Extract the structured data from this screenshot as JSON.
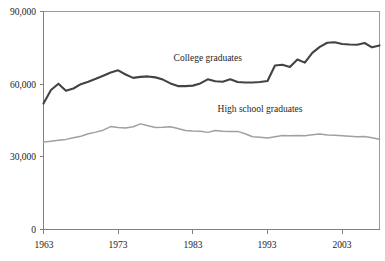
{
  "chart_data": {
    "type": "line",
    "title": "",
    "subtitle": "",
    "xlabel": "",
    "ylabel": "",
    "xlim": [
      1963,
      2008
    ],
    "ylim": [
      0,
      90000
    ],
    "grid": false,
    "legend_position": "inline-annotation",
    "y_ticks": [
      0,
      30000,
      60000,
      90000
    ],
    "y_tick_labels": [
      "0",
      "30,000",
      "60,000",
      "90,000"
    ],
    "x_ticks": [
      1963,
      1973,
      1983,
      1993,
      2003
    ],
    "x_tick_labels": [
      "1963",
      "1973",
      "1983",
      "1993",
      "2003"
    ],
    "x": [
      1963,
      1964,
      1965,
      1966,
      1967,
      1968,
      1969,
      1970,
      1971,
      1972,
      1973,
      1974,
      1975,
      1976,
      1977,
      1978,
      1979,
      1980,
      1981,
      1982,
      1983,
      1984,
      1985,
      1986,
      1987,
      1988,
      1989,
      1990,
      1991,
      1992,
      1993,
      1994,
      1995,
      1996,
      1997,
      1998,
      1999,
      2000,
      2001,
      2002,
      2003,
      2004,
      2005,
      2006,
      2007,
      2008
    ],
    "series": [
      {
        "name": "College graduates",
        "color": "#434343",
        "label_x": 1985,
        "label_y": 69500,
        "values": [
          52000,
          57600,
          60200,
          57300,
          58200,
          60000,
          61000,
          62200,
          63500,
          64800,
          65700,
          64000,
          62600,
          63000,
          63200,
          62800,
          61900,
          60300,
          59200,
          59200,
          59400,
          60300,
          62000,
          61200,
          61000,
          62000,
          60900,
          60700,
          60700,
          60900,
          61300,
          67700,
          68000,
          67100,
          70200,
          68900,
          72900,
          75400,
          77100,
          77300,
          76600,
          76400,
          76300,
          77000,
          75200,
          76000
        ]
      },
      {
        "name": "High school graduates",
        "color": "#a0a0a0",
        "label_x": 1992,
        "label_y": 48500,
        "values": [
          36100,
          36400,
          36800,
          37200,
          37900,
          38500,
          39500,
          40200,
          41000,
          42500,
          42100,
          41900,
          42400,
          43600,
          42800,
          42100,
          42200,
          42400,
          41700,
          40900,
          40700,
          40600,
          40100,
          40900,
          40600,
          40500,
          40500,
          39500,
          38300,
          38100,
          37800,
          38300,
          38800,
          38700,
          38800,
          38700,
          39100,
          39400,
          39000,
          38900,
          38700,
          38500,
          38300,
          38400,
          37900,
          37300
        ]
      }
    ]
  }
}
